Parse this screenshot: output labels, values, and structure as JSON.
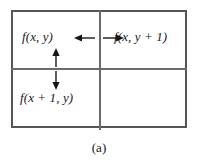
{
  "figure": {
    "caption": "(a)",
    "colors": {
      "outer_border": "#55555a",
      "divider": "#6a6a6e",
      "text": "#17171a",
      "arrow": "#17171a",
      "background": "#ffffff"
    },
    "grid": {
      "rows": 2,
      "columns": 2,
      "cells": [
        {
          "position": "top-left",
          "label": "f(x, y)"
        },
        {
          "position": "top-right",
          "label": "f(x, y + 1)"
        },
        {
          "position": "bottom-left",
          "label": "f(x + 1, y)"
        },
        {
          "position": "bottom-right",
          "label": ""
        }
      ]
    },
    "arrows": [
      {
        "name": "arrow-left",
        "direction": "left",
        "description": "points left toward f(x, y)"
      },
      {
        "name": "arrow-right",
        "direction": "right",
        "description": "points right toward f(x, y + 1)"
      },
      {
        "name": "arrow-up",
        "direction": "up",
        "description": "points up toward f(x, y)"
      },
      {
        "name": "arrow-down",
        "direction": "down",
        "description": "points down toward f(x + 1, y)"
      }
    ]
  }
}
